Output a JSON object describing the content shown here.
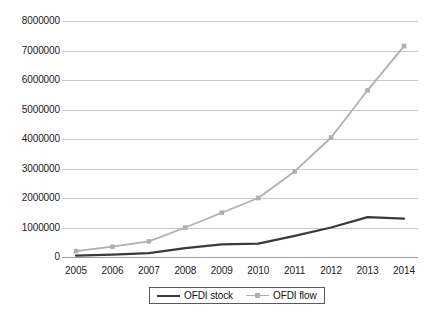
{
  "chart_data": {
    "type": "line",
    "title": "",
    "subtitle": "",
    "xlabel": "",
    "ylabel": "",
    "categories": [
      "2005",
      "2006",
      "2007",
      "2008",
      "2009",
      "2010",
      "2011",
      "2012",
      "2013",
      "2014"
    ],
    "series": [
      {
        "name": "OFDI stock",
        "color": "#3a3a3a",
        "marker": "none",
        "values": [
          50000,
          80000,
          130000,
          300000,
          430000,
          450000,
          720000,
          1000000,
          1350000,
          1300000
        ]
      },
      {
        "name": "OFDI flow",
        "color": "#b0b0b0",
        "marker": "square",
        "values": [
          200000,
          350000,
          530000,
          1000000,
          1500000,
          2000000,
          2900000,
          4050000,
          5650000,
          7150000
        ]
      }
    ],
    "ylim": [
      0,
      8000000
    ],
    "ytick_step": 1000000,
    "yticks": [
      "0",
      "1000000",
      "2000000",
      "3000000",
      "4000000",
      "5000000",
      "6000000",
      "7000000",
      "8000000"
    ],
    "grid": "horizontal",
    "legend_position": "bottom-center",
    "axis_colors": {
      "gridline": "#c8c8c8",
      "zero_line": "#9a9a9a",
      "tick_text": "#1a1a1a",
      "legend_border": "#5a5a5a",
      "background": "#ffffff"
    }
  }
}
